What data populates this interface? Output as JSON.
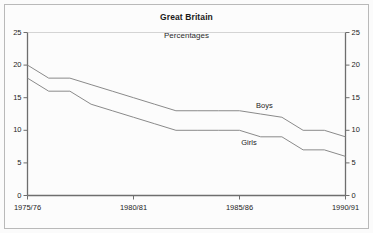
{
  "figure": {
    "title": "Great Britain",
    "subtitle": "Percentages",
    "background": "#fbfbfb",
    "frame_color": "#b9b9b9",
    "axis_color": "#6e6e6e",
    "line_color": "#8a8a8a"
  },
  "chart_data": {
    "type": "line",
    "title": "Great Britain",
    "subtitle": "Percentages",
    "xlabel": "",
    "ylabel": "",
    "ylim": [
      0,
      25
    ],
    "ytick_values": [
      0,
      5,
      10,
      15,
      20,
      25
    ],
    "ytick_labels_left": [
      "0",
      "5",
      "10",
      "15",
      "20",
      "25"
    ],
    "ytick_labels_right": [
      "0",
      "5",
      "10",
      "15",
      "20",
      "25"
    ],
    "grid": false,
    "legend_position": "inline-annotation",
    "dual_y_axis": true,
    "x": [
      "1975/76",
      "1976/77",
      "1977/78",
      "1978/79",
      "1979/80",
      "1980/81",
      "1981/82",
      "1982/83",
      "1983/84",
      "1984/85",
      "1985/86",
      "1986/87",
      "1987/88",
      "1988/89",
      "1989/90",
      "1990/91"
    ],
    "xtick_labels": [
      "1975/76",
      "1980/81",
      "1985/86",
      "1990/91"
    ],
    "xtick_positions": [
      0,
      5,
      10,
      15
    ],
    "series": [
      {
        "name": "Boys",
        "values": [
          20,
          18,
          18,
          17,
          16,
          15,
          14,
          13,
          13,
          13,
          13,
          12.5,
          12,
          10,
          10,
          9
        ]
      },
      {
        "name": "Girls",
        "values": [
          18,
          16,
          16,
          14,
          13,
          12,
          11,
          10,
          10,
          10,
          10,
          9,
          9,
          7,
          7,
          6
        ]
      }
    ],
    "annotations": [
      {
        "text": "Boys",
        "x_index": 11.3,
        "y_value": 13.8
      },
      {
        "text": "Girls",
        "x_index": 10.6,
        "y_value": 8.1
      }
    ]
  }
}
